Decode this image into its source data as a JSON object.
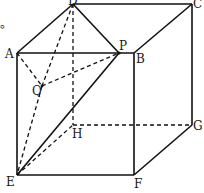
{
  "figure": {
    "type": "cube-geometry",
    "vertices": {
      "A": "A",
      "B": "B",
      "C": "C",
      "D": "D",
      "E": "E",
      "F": "F",
      "G": "G",
      "H": "H",
      "P": "P",
      "Q": "Q"
    },
    "stray_mark": "。",
    "solid_edges": [
      [
        "A",
        "D"
      ],
      [
        "D",
        "C"
      ],
      [
        "A",
        "B"
      ],
      [
        "B",
        "C"
      ],
      [
        "C",
        "G"
      ],
      [
        "A",
        "E"
      ],
      [
        "E",
        "F"
      ],
      [
        "B",
        "F"
      ],
      [
        "F",
        "G"
      ],
      [
        "D",
        "P"
      ],
      [
        "E",
        "P"
      ]
    ],
    "dashed_edges": [
      [
        "D",
        "H"
      ],
      [
        "H",
        "G"
      ],
      [
        "E",
        "H"
      ],
      [
        "D",
        "Q"
      ],
      [
        "Q",
        "E"
      ],
      [
        "A",
        "Q"
      ],
      [
        "Q",
        "B"
      ]
    ]
  }
}
